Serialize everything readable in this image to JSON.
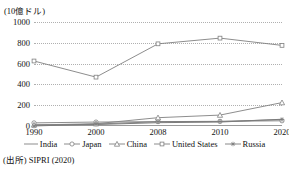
{
  "figure": {
    "title_clipped_remnant": "",
    "source_note": "(出所) SIPRI (2020)"
  },
  "chart_data": {
    "type": "line",
    "title": "",
    "unit_label": "(10億ドル)",
    "xlabel": "",
    "ylabel": "",
    "categories": [
      "1990",
      "2000",
      "2008",
      "2010",
      "2020"
    ],
    "ylim": [
      0,
      1000
    ],
    "yticks": [
      "0",
      "200",
      "400",
      "600",
      "800",
      "1000"
    ],
    "grid": true,
    "legend_position": "bottom",
    "series": [
      {
        "name": "India",
        "marker": "none",
        "color": "#6e6e6e",
        "values": [
          11,
          14,
          32,
          38,
          65
        ]
      },
      {
        "name": "Japan",
        "marker": "circle",
        "color": "#808080",
        "values": [
          30,
          38,
          42,
          45,
          50
        ]
      },
      {
        "name": "China",
        "marker": "triangle",
        "color": "#808080",
        "values": [
          10,
          22,
          80,
          105,
          225
        ]
      },
      {
        "name": "United States",
        "marker": "square",
        "color": "#808080",
        "values": [
          625,
          470,
          790,
          845,
          775
        ]
      },
      {
        "name": "Russia",
        "marker": "asterisk",
        "color": "#7a7a7a",
        "values": [
          0,
          19,
          41,
          43,
          62
        ]
      }
    ]
  }
}
